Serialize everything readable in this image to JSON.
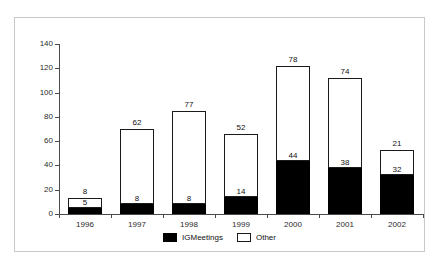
{
  "title_remnant": "",
  "chart_data": {
    "type": "bar",
    "subtype": "stacked-vertical",
    "title": "",
    "xlabel": "",
    "ylabel": "",
    "ylim": [
      0,
      140
    ],
    "yticks": [
      0,
      20,
      40,
      60,
      80,
      100,
      120,
      140
    ],
    "ytick_labels": [
      "0",
      "20",
      "40",
      "60",
      "80",
      "100",
      "120",
      "140"
    ],
    "grid": false,
    "legend_position": "bottom-center",
    "categories": [
      "1996",
      "1997",
      "1998",
      "1999",
      "2000",
      "2001",
      "2002"
    ],
    "series": [
      {
        "name": "IGMeetings",
        "color": "#000000",
        "values": [
          5,
          8,
          8,
          14,
          44,
          38,
          32
        ],
        "value_labels": [
          "5",
          "8",
          "8",
          "14",
          "44",
          "38",
          "32"
        ]
      },
      {
        "name": "Other",
        "color": "#ffffff",
        "values": [
          8,
          62,
          77,
          52,
          78,
          74,
          21
        ],
        "value_labels": [
          "8",
          "62",
          "77",
          "52",
          "78",
          "74",
          "21"
        ]
      }
    ],
    "stack_totals": [
      13,
      70,
      85,
      66,
      122,
      112,
      53
    ]
  },
  "legend": {
    "items": [
      {
        "label": "IGMeetings",
        "swatch": "black-filled"
      },
      {
        "label": "Other",
        "swatch": "white-outlined"
      }
    ]
  }
}
